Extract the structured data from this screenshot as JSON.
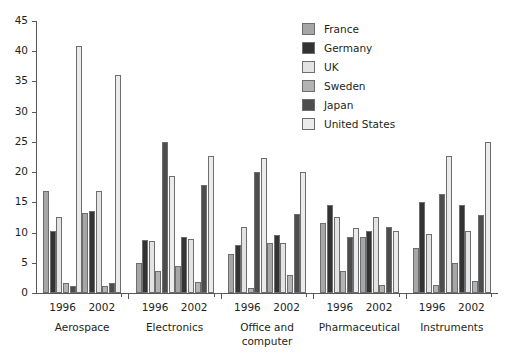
{
  "chart_data": {
    "type": "bar",
    "title": "",
    "subtitle": "",
    "xlabel": "",
    "ylabel": "",
    "ylim": [
      0,
      45
    ],
    "yticks": [
      0,
      5,
      10,
      15,
      20,
      25,
      30,
      35,
      40,
      45
    ],
    "grid": false,
    "legend_position": "top-right",
    "legend": [
      "France",
      "Germany",
      "UK",
      "Sweden",
      "Japan",
      "United States"
    ],
    "colors": {
      "France": "#a6a6a6",
      "Germany": "#333333",
      "UK": "#e3e3e3",
      "Sweden": "#b3b3b3",
      "Japan": "#4d4d4d",
      "United States": "#ebebeb"
    },
    "groups": [
      "Aerospace",
      "Electronics",
      "Office and computer",
      "Pharmaceutical",
      "Instruments"
    ],
    "categories": [
      "Aerospace 1996",
      "Aerospace 2002",
      "Electronics 1996",
      "Electronics 2002",
      "Office and computer 1996",
      "Office and computer 2002",
      "Pharmaceutical 1996",
      "Pharmaceutical 2002",
      "Instruments 1996",
      "Instruments 2002"
    ],
    "series": [
      {
        "name": "France",
        "values": [
          16.8,
          13.2,
          5.0,
          4.4,
          6.4,
          8.2,
          11.6,
          9.2,
          7.5,
          5.0
        ]
      },
      {
        "name": "Germany",
        "values": [
          10.3,
          13.5,
          8.8,
          9.2,
          8.0,
          9.6,
          14.5,
          10.3,
          15.0,
          14.5
        ]
      },
      {
        "name": "UK",
        "values": [
          12.5,
          16.8,
          8.6,
          8.9,
          11.0,
          8.3,
          12.6,
          12.5,
          9.8,
          10.3
        ]
      },
      {
        "name": "Sweden",
        "values": [
          1.6,
          1.1,
          3.7,
          1.9,
          0.9,
          2.9,
          3.6,
          1.3,
          1.3,
          2.0
        ]
      },
      {
        "name": "Japan",
        "values": [
          1.2,
          1.7,
          25.0,
          17.8,
          20.0,
          13.0,
          9.2,
          11.0,
          16.3,
          12.9
        ]
      },
      {
        "name": "United States",
        "values": [
          40.8,
          36.0,
          19.3,
          22.6,
          22.3,
          20.1,
          10.7,
          10.3,
          22.7,
          25.0
        ]
      }
    ]
  },
  "axes": {
    "y_tick_labels": [
      "0",
      "5",
      "10",
      "15",
      "20",
      "25",
      "30",
      "35",
      "40",
      "45"
    ]
  },
  "xaxis": {
    "groups": [
      {
        "name": "Aerospace",
        "label": "Aerospace",
        "years": [
          "1996",
          "2002"
        ]
      },
      {
        "name": "Electronics",
        "label": "Electronics",
        "years": [
          "1996",
          "2002"
        ]
      },
      {
        "name": "Office and computer",
        "label": "Office and\ncomputer",
        "label_line1": "Office and",
        "label_line2": "computer",
        "years": [
          "1996",
          "2002"
        ]
      },
      {
        "name": "Pharmaceutical",
        "label": "Pharmaceutical",
        "years": [
          "1996",
          "2002"
        ]
      },
      {
        "name": "Instruments",
        "label": "Instruments",
        "years": [
          "1996",
          "2002"
        ]
      }
    ]
  },
  "legend": {
    "items": [
      {
        "label": "France",
        "color": "#a6a6a6",
        "icon": "legend-swatch-france"
      },
      {
        "label": "Germany",
        "color": "#333333",
        "icon": "legend-swatch-germany"
      },
      {
        "label": "UK",
        "color": "#e3e3e3",
        "icon": "legend-swatch-uk"
      },
      {
        "label": "Sweden",
        "color": "#b3b3b3",
        "icon": "legend-swatch-sweden"
      },
      {
        "label": "Japan",
        "color": "#4d4d4d",
        "icon": "legend-swatch-japan"
      },
      {
        "label": "United States",
        "color": "#ebebeb",
        "icon": "legend-swatch-united-states"
      }
    ]
  }
}
